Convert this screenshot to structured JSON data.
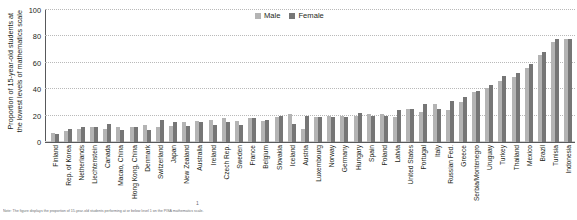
{
  "chart": {
    "ylabel": "Proportion of 15-year-old students at\nthe lowest levels of mathematics scale",
    "ylabel_line1": "Proportion of 15-year-old students at",
    "ylabel_line2": "the lowest levels of mathematics scale",
    "legend": {
      "male_label": "Male",
      "female_label": "Female"
    },
    "colors": {
      "male": "#b4b4b4",
      "female": "#767676",
      "axis": "#58595b",
      "grid": "#b9b9b9",
      "text": "#231f20"
    },
    "footnote_mark": "1",
    "footnote": "Note: The figure displays the proportion of 15-year-old students performing at or below level 1 on the PISA mathematics scale."
  },
  "chart_data": {
    "type": "bar",
    "title": "",
    "xlabel": "",
    "ylabel": "Proportion of 15-year-old students at the lowest levels of mathematics scale",
    "ylim": [
      0,
      100
    ],
    "yticks": [
      0,
      20,
      40,
      60,
      80,
      100
    ],
    "grid": true,
    "legend_position": "top-center",
    "categories": [
      "Finland",
      "Rep. of Korea",
      "Netherlands",
      "Liechtenstein",
      "Canada",
      "Macao, China",
      "Hong Kong, China",
      "Denmark",
      "Switzerland",
      "Japan",
      "New Zealand",
      "Australia",
      "Ireland",
      "Czech Rep.",
      "Sweden",
      "France",
      "Belgium",
      "Slovakia",
      "Iceland",
      "Austria",
      "Luxembourg",
      "Norway",
      "Germany",
      "Hungary",
      "Spain",
      "Poland",
      "Latvia",
      "United States",
      "Portugal",
      "Italy",
      "Russian Fed.",
      "Greece",
      "Serbia/Montenegro",
      "Uruguay",
      "Turkey",
      "Thailand",
      "Mexico",
      "Brazil",
      "Tunisia",
      "Indonesia"
    ],
    "series": [
      {
        "name": "Male",
        "values": [
          7,
          8,
          10,
          11,
          10,
          11,
          11,
          13,
          11,
          12,
          15,
          16,
          17,
          18,
          16,
          18,
          16,
          19,
          21,
          10,
          19,
          20,
          20,
          20,
          21,
          21,
          19,
          25,
          23,
          29,
          24,
          30,
          38,
          41,
          46,
          49,
          56,
          66,
          76,
          78
        ],
        "color": "#b4b4b4"
      },
      {
        "name": "Female",
        "values": [
          6,
          10,
          11,
          11,
          14,
          9,
          11,
          9,
          17,
          15,
          12,
          15,
          13,
          15,
          13,
          18,
          17,
          20,
          14,
          20,
          19,
          19,
          19,
          22,
          20,
          20,
          24,
          25,
          29,
          25,
          31,
          34,
          39,
          43,
          50,
          52,
          59,
          68,
          78,
          78
        ],
        "color": "#767676"
      }
    ]
  }
}
